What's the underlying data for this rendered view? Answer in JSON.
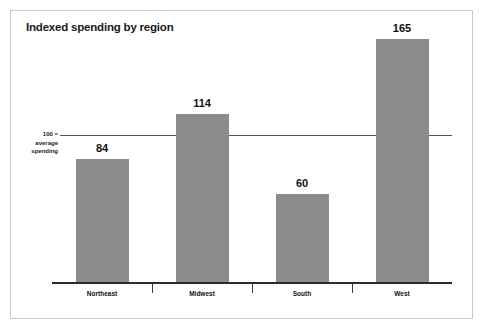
{
  "chart_data": {
    "type": "bar",
    "title": "Indexed spending by region",
    "categories": [
      "Northeast",
      "Midwest",
      "South",
      "West"
    ],
    "values": [
      84,
      114,
      60,
      165
    ],
    "xlabel": "",
    "ylabel": "",
    "ylim": [
      0,
      180
    ],
    "grid": false,
    "legend": false,
    "reference_line": {
      "value": 100,
      "label_lines": [
        "100 =",
        "average",
        "spending"
      ]
    },
    "colors": {
      "bar": "#8c8c8c",
      "axis": "#2b2b2b",
      "reference_line": "#555555",
      "frame": "#c9c9c9",
      "text": "#111111",
      "background": "#ffffff"
    },
    "data_labels": [
      "84",
      "114",
      "60",
      "165"
    ]
  }
}
